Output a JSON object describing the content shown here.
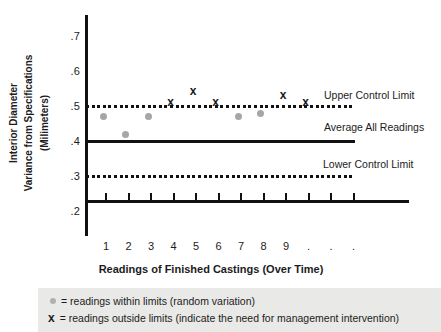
{
  "y_axis": {
    "title_lines": [
      "Interior Diameter",
      "Variance from Specifications",
      "(Milimeters)"
    ],
    "tick_labels": [
      ".7",
      ".6",
      ".5",
      ".4",
      ".3",
      ".2"
    ]
  },
  "x_axis": {
    "title": "Readings of Finished Castings (Over Time)",
    "tick_labels": [
      "1",
      "2",
      "3",
      "4",
      "5",
      "6",
      "7",
      "8",
      "9",
      ".",
      ".",
      "."
    ]
  },
  "control_lines": {
    "upper": {
      "label": "Upper Control Limit",
      "value": 0.5
    },
    "average": {
      "label": "Average All Readings",
      "value": 0.4
    },
    "lower": {
      "label": "Lower Control Limit",
      "value": 0.3
    }
  },
  "legend": {
    "within_text": "= readings within limits (random variation)",
    "outside_marker": "x",
    "outside_text": "= readings outside limits (indicate the need for management intervention)"
  },
  "chart_data": {
    "type": "scatter",
    "title": "",
    "xlabel": "Readings of Finished Castings (Over Time)",
    "ylabel": "Interior Diameter Variance from Specifications (Milimeters)",
    "x": [
      1,
      2,
      3,
      4,
      5,
      6,
      7,
      8,
      9,
      10
    ],
    "values": [
      0.47,
      0.42,
      0.47,
      0.51,
      0.54,
      0.51,
      0.47,
      0.48,
      0.53,
      0.51
    ],
    "point_types": [
      "within",
      "within",
      "within",
      "outside",
      "outside",
      "outside",
      "within",
      "within",
      "outside",
      "outside"
    ],
    "upper_control_limit": 0.5,
    "average_all_readings": 0.4,
    "lower_control_limit": 0.3,
    "ylim": [
      0.15,
      0.75
    ],
    "y_ticks": [
      0.2,
      0.3,
      0.4,
      0.5,
      0.6,
      0.7
    ],
    "grid": false,
    "legend_position": "bottom",
    "colors": {
      "within": "#a6a6a6",
      "outside": "#1a1a1a"
    }
  }
}
